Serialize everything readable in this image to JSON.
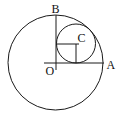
{
  "diagram": {
    "type": "geometry",
    "colors": {
      "stroke": "#1a1a1a",
      "background": "#ffffff",
      "label": "#111111"
    },
    "labels": {
      "O": "O",
      "A": "A",
      "B": "B",
      "C": "C"
    },
    "points": {
      "O": {
        "x": 56,
        "y": 63
      },
      "A": {
        "x": 103.5,
        "y": 63
      },
      "B": {
        "x": 56,
        "y": 15.5
      },
      "C": {
        "x": 76,
        "y": 43.5
      }
    },
    "circles": [
      {
        "name": "large-circle",
        "cx": 55.5,
        "cy": 62.5,
        "r": 47.5
      },
      {
        "name": "small-circle",
        "cx": 76,
        "cy": 43.5,
        "r": 19.5
      }
    ],
    "segments": [
      {
        "name": "radius-OA",
        "from": "O",
        "to": "A"
      },
      {
        "name": "radius-OB",
        "from": "O",
        "to": "B"
      },
      {
        "name": "C-to-OB-perpendicular",
        "from": "C",
        "to": "OB"
      },
      {
        "name": "C-to-OA-perpendicular",
        "from": "C",
        "to": "OA"
      }
    ]
  }
}
